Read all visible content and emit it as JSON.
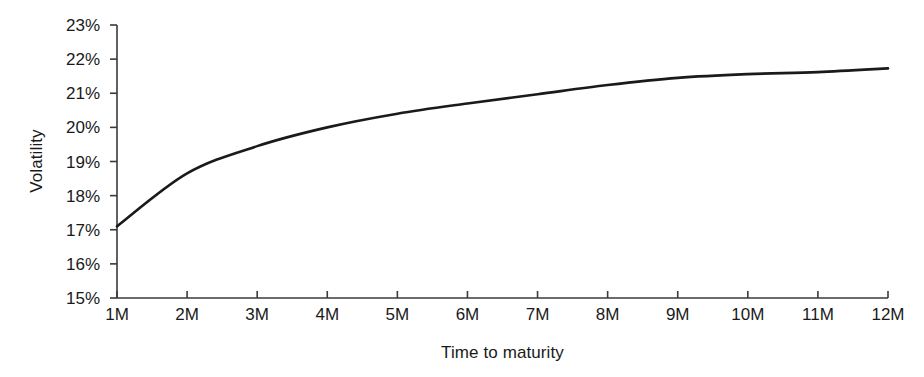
{
  "chart_data": {
    "type": "line",
    "title": "",
    "xlabel": "Time to maturity",
    "ylabel": "Volatility",
    "categories": [
      "1M",
      "2M",
      "3M",
      "4M",
      "5M",
      "6M",
      "7M",
      "8M",
      "9M",
      "10M",
      "11M",
      "12M"
    ],
    "x": [
      1,
      2,
      3,
      4,
      5,
      6,
      7,
      8,
      9,
      10,
      11,
      12
    ],
    "values": [
      17.1,
      18.65,
      19.45,
      20.0,
      20.4,
      20.7,
      20.97,
      21.24,
      21.45,
      21.56,
      21.62,
      21.73
    ],
    "y_tick_labels": [
      "15%",
      "16%",
      "17%",
      "18%",
      "19%",
      "20%",
      "21%",
      "22%",
      "23%"
    ],
    "y_ticks": [
      15,
      16,
      17,
      18,
      19,
      20,
      21,
      22,
      23
    ],
    "ylim": [
      15,
      23
    ],
    "xlim": [
      1,
      12
    ],
    "grid": false,
    "legend": false,
    "series": [
      {
        "name": "Volatility term structure",
        "color": "#1a1a1a",
        "values": [
          17.1,
          18.65,
          19.45,
          20.0,
          20.4,
          20.7,
          20.97,
          21.24,
          21.45,
          21.56,
          21.62,
          21.73
        ]
      }
    ]
  },
  "axes": {
    "y_title": "Volatility",
    "x_title": "Time to maturity",
    "axis_color": "#3a3a3a",
    "line_color": "#1a1a1a"
  }
}
